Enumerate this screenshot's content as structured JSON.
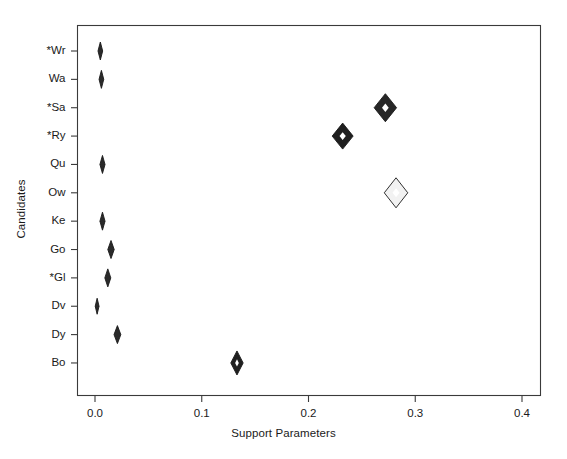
{
  "chart_data": {
    "type": "scatter",
    "title": "",
    "xlabel": "Support Parameters",
    "ylabel": "Candidates",
    "xlim": [
      -0.017,
      0.434
    ],
    "xticks": [
      0.0,
      0.1,
      0.2,
      0.3,
      0.4
    ],
    "xtick_labels": [
      "0.0",
      "0.1",
      "0.2",
      "0.3",
      "0.4"
    ],
    "categories": [
      "*Wr",
      "Wa",
      "*Sa",
      "*Ry",
      "Qu",
      "Ow",
      "Ke",
      "Go",
      "*Gl",
      "Dv",
      "Dy",
      "Bo"
    ],
    "grid": false,
    "legend": null,
    "marker": "diamond",
    "note": "Marker horizontal half-width encodes the uncertainty/interval of each support parameter estimate.",
    "points": [
      {
        "category": "*Wr",
        "value": 0.005,
        "half_width": 0.0022,
        "half_height": 9,
        "fill": "#2a2a2a",
        "style": "filled"
      },
      {
        "category": "Wa",
        "value": 0.006,
        "half_width": 0.0022,
        "half_height": 9,
        "fill": "#2a2a2a",
        "style": "filled"
      },
      {
        "category": "*Sa",
        "value": 0.272,
        "half_width": 0.0105,
        "half_height": 14,
        "fill": "#262626",
        "style": "filled"
      },
      {
        "category": "*Ry",
        "value": 0.232,
        "half_width": 0.0098,
        "half_height": 13,
        "fill": "#1f1f1f",
        "style": "filled"
      },
      {
        "category": "Qu",
        "value": 0.007,
        "half_width": 0.0024,
        "half_height": 9,
        "fill": "#2a2a2a",
        "style": "filled"
      },
      {
        "category": "Ow",
        "value": 0.282,
        "half_width": 0.011,
        "half_height": 15,
        "fill": "#f2f2f2",
        "style": "open"
      },
      {
        "category": "Ke",
        "value": 0.007,
        "half_width": 0.0024,
        "half_height": 9,
        "fill": "#2a2a2a",
        "style": "filled"
      },
      {
        "category": "Go",
        "value": 0.015,
        "half_width": 0.003,
        "half_height": 9,
        "fill": "#2a2a2a",
        "style": "filled"
      },
      {
        "category": "*Gl",
        "value": 0.012,
        "half_width": 0.0028,
        "half_height": 9,
        "fill": "#2a2a2a",
        "style": "filled"
      },
      {
        "category": "Dv",
        "value": 0.002,
        "half_width": 0.0018,
        "half_height": 8,
        "fill": "#2a2a2a",
        "style": "filled"
      },
      {
        "category": "Dy",
        "value": 0.021,
        "half_width": 0.0032,
        "half_height": 9,
        "fill": "#2a2a2a",
        "style": "filled"
      },
      {
        "category": "Bo",
        "value": 0.133,
        "half_width": 0.0058,
        "half_height": 12,
        "fill": "#1f1f1f",
        "style": "filled"
      }
    ]
  },
  "colors": {
    "axis": "#3a3a3a",
    "text": "#1a1a1a",
    "marker_dark": "#262626",
    "marker_light": "#f2f2f2",
    "background": "#ffffff"
  }
}
